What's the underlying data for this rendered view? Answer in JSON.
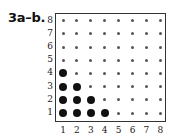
{
  "label": "3a–b.",
  "chart_data": {
    "type": "scatter",
    "title": "3a–b.",
    "xlabel": "",
    "ylabel": "",
    "x_ticks": [
      "1",
      "2",
      "3",
      "4",
      "5",
      "6",
      "7",
      "8"
    ],
    "y_ticks": [
      "1",
      "2",
      "3",
      "4",
      "5",
      "6",
      "7",
      "8"
    ],
    "xlim": [
      1,
      8
    ],
    "ylim": [
      1,
      8
    ],
    "grid": "8x8 dot lattice (small dots at every integer point)",
    "highlighted_points": [
      [
        1,
        1
      ],
      [
        2,
        1
      ],
      [
        3,
        1
      ],
      [
        4,
        1
      ],
      [
        1,
        2
      ],
      [
        2,
        2
      ],
      [
        3,
        2
      ],
      [
        1,
        3
      ],
      [
        2,
        3
      ],
      [
        1,
        4
      ]
    ],
    "highlight_rule": "x + y <= 5"
  }
}
